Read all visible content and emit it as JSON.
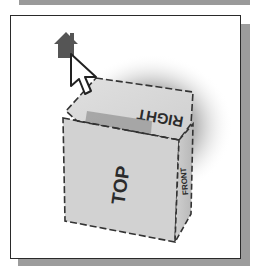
{
  "viewcube": {
    "faces": {
      "top": "TOP",
      "right": "RIGHT",
      "front": "FRONT"
    },
    "home_button": {
      "icon": "home-icon",
      "color": "#555555"
    },
    "cursor": {
      "icon": "arrow-cursor-icon"
    }
  },
  "colors": {
    "frame_border": "#2a2a2a",
    "frame_shadow": "#9c9c9c",
    "cube_face": "#d4d4d4",
    "cube_edge": "#333333",
    "highlight": "#9e9e9e"
  }
}
